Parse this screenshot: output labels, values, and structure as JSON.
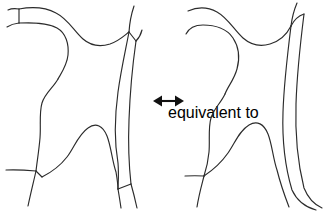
{
  "figure": {
    "title": "Curve network equivalence",
    "background_color": "#ffffff",
    "stroke_color": "#2b2b2b",
    "arrow_color": "#111111",
    "width": 331,
    "height": 213,
    "panel_count": 2,
    "relation_symbol": "<->",
    "relation_label": "equivalent to"
  },
  "left_panel": {
    "name": "left-diagram",
    "description": "Curve network with four short bridge segments at junctions",
    "bridge_count": 4,
    "bridges": [
      {
        "id": "bridge-top-left",
        "x1": 19,
        "y1": 9,
        "x2": 19,
        "y2": 23
      },
      {
        "id": "bridge-top-right",
        "x1": 129,
        "y1": 32,
        "x2": 136,
        "y2": 41
      },
      {
        "id": "bridge-bottom-left",
        "x1": 36,
        "y1": 171,
        "x2": 42,
        "y2": 177
      },
      {
        "id": "bridge-bottom-right",
        "x1": 118,
        "y1": 189,
        "x2": 131,
        "y2": 184
      }
    ]
  },
  "right_panel": {
    "name": "right-diagram",
    "description": "Same curve network drawn with smooth junctions and no bridge segments",
    "bridge_count": 0,
    "bridges": []
  },
  "arrow": {
    "name": "double-headed-arrow",
    "x_start": 153,
    "x_end": 184,
    "y": 101,
    "head_length": 9,
    "head_half_height": 5.5,
    "shaft_width": 2.1,
    "direction": "bidirectional"
  }
}
